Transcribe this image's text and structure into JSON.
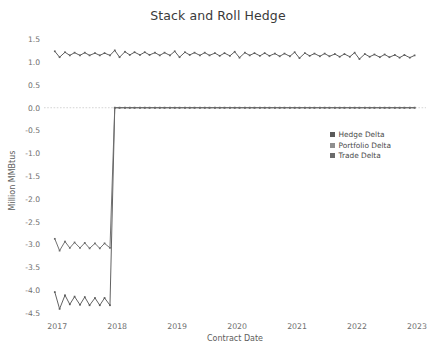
{
  "chart_data": {
    "type": "line",
    "title": "Stack and Roll Hedge",
    "xlabel": "Contract Date",
    "ylabel": "Million MMBtus",
    "grid": false,
    "legend_position": "center-right",
    "xlim": [
      2016.78,
      2023.15
    ],
    "ylim": [
      -4.62,
      1.62
    ],
    "x_ticks": [
      "2017",
      "2018",
      "2019",
      "2020",
      "2021",
      "2022",
      "2023"
    ],
    "x_tick_values": [
      2017,
      2018,
      2019,
      2020,
      2021,
      2022,
      2023
    ],
    "y_ticks": [
      "1.5",
      "1.0",
      "0.5",
      "0.0",
      "-0.5",
      "-1.0",
      "-1.5",
      "-2.0",
      "-2.5",
      "-3.0",
      "-3.5",
      "-4.0",
      "-4.5"
    ],
    "y_tick_values": [
      1.5,
      1.0,
      0.5,
      0.0,
      -0.5,
      -1.0,
      -1.5,
      -2.0,
      -2.5,
      -3.0,
      -3.5,
      -4.0,
      -4.5
    ],
    "zero_line": 0.0,
    "series": [
      {
        "name": "Hedge Delta",
        "color": "#5a5a5a",
        "marker": "square",
        "x": [
          2016.96,
          2017.04,
          2017.13,
          2017.21,
          2017.29,
          2017.38,
          2017.46,
          2017.54,
          2017.63,
          2017.71,
          2017.79,
          2017.88,
          2017.96,
          2018.04,
          2018.13,
          2018.21,
          2018.29,
          2018.38,
          2018.46,
          2018.54,
          2018.63,
          2018.71,
          2018.79,
          2018.88,
          2018.96,
          2019.04,
          2019.13,
          2019.21,
          2019.29,
          2019.38,
          2019.46,
          2019.54,
          2019.63,
          2019.71,
          2019.79,
          2019.88,
          2019.96,
          2020.04,
          2020.13,
          2020.21,
          2020.29,
          2020.38,
          2020.46,
          2020.54,
          2020.63,
          2020.71,
          2020.79,
          2020.88,
          2020.96,
          2021.04,
          2021.13,
          2021.21,
          2021.29,
          2021.38,
          2021.46,
          2021.54,
          2021.63,
          2021.71,
          2021.79,
          2021.88,
          2021.96,
          2022.04,
          2022.13,
          2022.21,
          2022.29,
          2022.38,
          2022.46,
          2022.54,
          2022.63,
          2022.71,
          2022.79,
          2022.88,
          2022.96
        ],
        "values": [
          -4.05,
          -4.42,
          -4.12,
          -4.32,
          -4.15,
          -4.33,
          -4.16,
          -4.34,
          -4.18,
          -4.34,
          -4.18,
          -4.34,
          0.0,
          0.0,
          0.0,
          0.0,
          0.0,
          0.0,
          0.0,
          0.0,
          0.0,
          0.0,
          0.0,
          0.0,
          0.0,
          0.0,
          0.0,
          0.0,
          0.0,
          0.0,
          0.0,
          0.0,
          0.0,
          0.0,
          0.0,
          0.0,
          0.0,
          0.0,
          0.0,
          0.0,
          0.0,
          0.0,
          0.0,
          0.0,
          0.0,
          0.0,
          0.0,
          0.0,
          0.0,
          0.0,
          0.0,
          0.0,
          0.0,
          0.0,
          0.0,
          0.0,
          0.0,
          0.0,
          0.0,
          0.0,
          0.0,
          0.0,
          0.0,
          0.0,
          0.0,
          0.0,
          0.0,
          0.0,
          0.0,
          0.0,
          0.0,
          0.0,
          0.0
        ]
      },
      {
        "name": "Portfolio Delta",
        "color": "#6a6a6a",
        "marker": "square",
        "x": [
          2016.96,
          2017.04,
          2017.13,
          2017.21,
          2017.29,
          2017.38,
          2017.46,
          2017.54,
          2017.63,
          2017.71,
          2017.79,
          2017.88,
          2017.96,
          2018.04,
          2018.13,
          2018.21,
          2018.29,
          2018.38,
          2018.46,
          2018.54,
          2018.63,
          2018.71,
          2018.79,
          2018.88,
          2018.96,
          2019.04,
          2019.13,
          2019.21,
          2019.29,
          2019.38,
          2019.46,
          2019.54,
          2019.63,
          2019.71,
          2019.79,
          2019.88,
          2019.96,
          2020.04,
          2020.13,
          2020.21,
          2020.29,
          2020.38,
          2020.46,
          2020.54,
          2020.63,
          2020.71,
          2020.79,
          2020.88,
          2020.96,
          2021.04,
          2021.13,
          2021.21,
          2021.29,
          2021.38,
          2021.46,
          2021.54,
          2021.63,
          2021.71,
          2021.79,
          2021.88,
          2021.96,
          2022.04,
          2022.13,
          2022.21,
          2022.29,
          2022.38,
          2022.46,
          2022.54,
          2022.63,
          2022.71,
          2022.79,
          2022.88,
          2022.96
        ],
        "values": [
          -2.88,
          -3.14,
          -2.94,
          -3.08,
          -2.96,
          -3.08,
          -2.97,
          -3.09,
          -2.98,
          -3.09,
          -2.98,
          -3.08,
          0.0,
          0.0,
          0.0,
          0.0,
          0.0,
          0.0,
          0.0,
          0.0,
          0.0,
          0.0,
          0.0,
          0.0,
          0.0,
          0.0,
          0.0,
          0.0,
          0.0,
          0.0,
          0.0,
          0.0,
          0.0,
          0.0,
          0.0,
          0.0,
          0.0,
          0.0,
          0.0,
          0.0,
          0.0,
          0.0,
          0.0,
          0.0,
          0.0,
          0.0,
          0.0,
          0.0,
          0.0,
          0.0,
          0.0,
          0.0,
          0.0,
          0.0,
          0.0,
          0.0,
          0.0,
          0.0,
          0.0,
          0.0,
          0.0,
          0.0,
          0.0,
          0.0,
          0.0,
          0.0,
          0.0,
          0.0,
          0.0,
          0.0,
          0.0,
          0.0,
          0.0
        ]
      },
      {
        "name": "Trade Delta",
        "color": "#5f5f5f",
        "marker": "square",
        "x": [
          2016.96,
          2017.04,
          2017.13,
          2017.21,
          2017.29,
          2017.38,
          2017.46,
          2017.54,
          2017.63,
          2017.71,
          2017.79,
          2017.88,
          2017.96,
          2018.04,
          2018.13,
          2018.21,
          2018.29,
          2018.38,
          2018.46,
          2018.54,
          2018.63,
          2018.71,
          2018.79,
          2018.88,
          2018.96,
          2019.04,
          2019.13,
          2019.21,
          2019.29,
          2019.38,
          2019.46,
          2019.54,
          2019.63,
          2019.71,
          2019.79,
          2019.88,
          2019.96,
          2020.04,
          2020.13,
          2020.21,
          2020.29,
          2020.38,
          2020.46,
          2020.54,
          2020.63,
          2020.71,
          2020.79,
          2020.88,
          2020.96,
          2021.04,
          2021.13,
          2021.21,
          2021.29,
          2021.38,
          2021.46,
          2021.54,
          2021.63,
          2021.71,
          2021.79,
          2021.88,
          2021.96,
          2022.04,
          2022.13,
          2022.21,
          2022.29,
          2022.38,
          2022.46,
          2022.54,
          2022.63,
          2022.71,
          2022.79,
          2022.88,
          2022.96
        ],
        "values": [
          1.24,
          1.11,
          1.22,
          1.15,
          1.21,
          1.15,
          1.21,
          1.15,
          1.2,
          1.15,
          1.2,
          1.15,
          1.26,
          1.11,
          1.23,
          1.16,
          1.22,
          1.16,
          1.22,
          1.16,
          1.21,
          1.15,
          1.21,
          1.15,
          1.24,
          1.11,
          1.22,
          1.16,
          1.21,
          1.15,
          1.21,
          1.15,
          1.2,
          1.14,
          1.2,
          1.14,
          1.23,
          1.1,
          1.21,
          1.15,
          1.2,
          1.14,
          1.2,
          1.14,
          1.19,
          1.13,
          1.19,
          1.13,
          1.22,
          1.09,
          1.2,
          1.14,
          1.19,
          1.13,
          1.19,
          1.13,
          1.18,
          1.12,
          1.18,
          1.12,
          1.21,
          1.07,
          1.18,
          1.12,
          1.17,
          1.11,
          1.17,
          1.11,
          1.16,
          1.1,
          1.16,
          1.1,
          1.15
        ]
      }
    ]
  },
  "legend": {
    "items": [
      {
        "label": "Hedge Delta",
        "color": "#5a5a5a"
      },
      {
        "label": "Portfolio Delta",
        "color": "#8f8f8f"
      },
      {
        "label": "Trade Delta",
        "color": "#6b6b6b"
      }
    ]
  },
  "axes": {
    "title": "Stack and Roll Hedge",
    "xlabel": "Contract Date",
    "ylabel": "Million MMBtus"
  }
}
